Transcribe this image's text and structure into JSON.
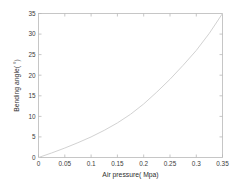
{
  "chart_data": {
    "type": "line",
    "title": "",
    "subtitle": "",
    "xlabel": "Air pressure(  Mpa)",
    "ylabel": "Bending angle(  °)",
    "xlim": [
      0,
      0.35
    ],
    "ylim": [
      0,
      35
    ],
    "grid": false,
    "legend": null,
    "legend_position": "none",
    "xticks": [
      "0",
      "0.05",
      "0.1",
      "0.15",
      "0.2",
      "0.25",
      "0.3",
      "0.35"
    ],
    "xtick_values": [
      0,
      0.05,
      0.1,
      0.15,
      0.2,
      0.25,
      0.3,
      0.35
    ],
    "yticks": [
      "0",
      "5",
      "10",
      "15",
      "20",
      "25",
      "30",
      "35"
    ],
    "ytick_values": [
      0,
      5,
      10,
      15,
      20,
      25,
      30,
      35
    ],
    "series": [
      {
        "name": "Bending angle vs air pressure",
        "color": "#d2d2d2",
        "style": "solid",
        "x": [
          0.0,
          0.025,
          0.05,
          0.075,
          0.1,
          0.125,
          0.15,
          0.175,
          0.2,
          0.225,
          0.25,
          0.275,
          0.3,
          0.325,
          0.35
        ],
        "values": [
          0.0,
          1.1,
          2.3,
          3.6,
          5.0,
          6.6,
          8.4,
          10.5,
          13.0,
          15.9,
          19.0,
          22.4,
          26.0,
          30.2,
          35.0
        ]
      }
    ],
    "annotations": []
  },
  "axes": {
    "x_axis_name": "air-pressure-axis",
    "y_axis_name": "bending-angle-axis"
  }
}
